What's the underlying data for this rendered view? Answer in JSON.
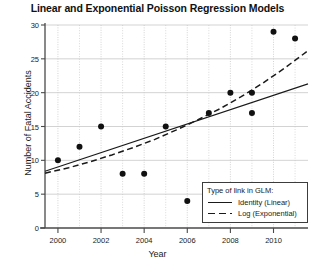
{
  "chart_data": {
    "type": "scatter",
    "title": "Linear and Exponential Poisson Regression Models",
    "xlabel": "Year",
    "ylabel": "Number of Fatal Accidents",
    "xlim": [
      1999.4,
      2011.6
    ],
    "ylim": [
      0,
      30
    ],
    "xticks": [
      2000,
      2002,
      2004,
      2006,
      2008,
      2010
    ],
    "yticks": [
      0,
      5,
      10,
      15,
      20,
      25,
      30
    ],
    "grid": true,
    "legend_position": "bottom-right",
    "legend_title": "Type of link in GLM:",
    "points": {
      "x": [
        2000,
        2001,
        2002,
        2003,
        2004,
        2005,
        2006,
        2007,
        2008,
        2009,
        2010,
        2011
      ],
      "y": [
        10,
        12,
        15,
        8,
        8,
        15,
        4,
        17,
        20,
        20,
        17,
        29,
        28
      ]
    },
    "scatter": [
      {
        "x": 2000,
        "y": 10
      },
      {
        "x": 2001,
        "y": 12
      },
      {
        "x": 2002,
        "y": 15
      },
      {
        "x": 2003,
        "y": 8
      },
      {
        "x": 2004,
        "y": 8
      },
      {
        "x": 2005,
        "y": 15
      },
      {
        "x": 2006,
        "y": 4
      },
      {
        "x": 2007,
        "y": 17
      },
      {
        "x": 2008,
        "y": 20
      },
      {
        "x": 2009,
        "y": 20
      },
      {
        "x": 2009,
        "y": 17
      },
      {
        "x": 2010,
        "y": 29
      },
      {
        "x": 2011,
        "y": 28
      }
    ],
    "series": [
      {
        "name": "Identity (Linear)",
        "style": "solid",
        "type": "line",
        "x": [
          1999.4,
          2011.6
        ],
        "y": [
          8.4,
          21.3
        ]
      },
      {
        "name": "Log (Exponential)",
        "style": "dashed",
        "type": "line",
        "x": [
          1999.4,
          2000.5,
          2001.5,
          2002.5,
          2003.5,
          2004.5,
          2005.5,
          2006.5,
          2007.5,
          2008.5,
          2009.5,
          2010.5,
          2011.6
        ],
        "y": [
          8.1,
          8.9,
          9.8,
          10.8,
          11.9,
          13.1,
          14.5,
          16.0,
          17.6,
          19.4,
          21.4,
          23.6,
          26.2
        ]
      }
    ],
    "colors": {
      "point": "#111111",
      "linear_line": "#1a1a1a",
      "exponential_line": "#1a1a1a",
      "grid": "#c8c8c8",
      "axis": "#4a4a4a",
      "background": "#ffffff"
    }
  }
}
